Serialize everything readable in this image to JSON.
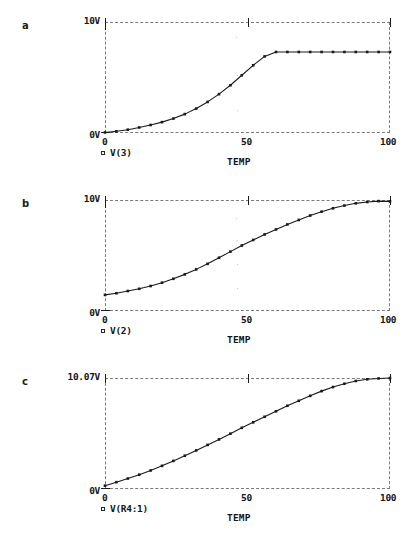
{
  "figure": {
    "background": "#ffffff",
    "line_color": "#1a1a1a",
    "axis_color": "#7b7b7b"
  },
  "panels": [
    {
      "letter": "a",
      "y_top_label": "10V",
      "y_bottom_label": "0V",
      "x_ticks": [
        "0",
        "50",
        "100"
      ],
      "x_axis_title": "TEMP",
      "legend_label": "V(3)",
      "chart_data": {
        "type": "line",
        "title": "",
        "xlabel": "TEMP",
        "ylabel": "",
        "xlim": [
          0,
          100
        ],
        "ylim": [
          0,
          10
        ],
        "ytick_labels": [
          "0V",
          "10V"
        ],
        "xtick_labels": [
          "0",
          "50",
          "100"
        ],
        "grid": false,
        "legend_position": "below-left",
        "series": [
          {
            "name": "V(3)",
            "markers": true,
            "x": [
              0,
              4,
              8,
              12,
              16,
              20,
              24,
              28,
              32,
              36,
              40,
              44,
              48,
              52,
              56,
              60,
              64,
              68,
              72,
              76,
              80,
              84,
              88,
              92,
              96,
              100
            ],
            "values": [
              0.05,
              0.15,
              0.3,
              0.5,
              0.72,
              0.98,
              1.3,
              1.7,
              2.2,
              2.8,
              3.5,
              4.3,
              5.2,
              6.1,
              6.9,
              7.3,
              7.3,
              7.3,
              7.3,
              7.3,
              7.3,
              7.3,
              7.3,
              7.3,
              7.3,
              7.3
            ]
          }
        ]
      }
    },
    {
      "letter": "b",
      "y_top_label": "10V",
      "y_bottom_label": "0V",
      "x_ticks": [
        "0",
        "50",
        "100"
      ],
      "x_axis_title": "TEMP",
      "legend_label": "V(2)",
      "chart_data": {
        "type": "line",
        "title": "",
        "xlabel": "TEMP",
        "ylabel": "",
        "xlim": [
          0,
          100
        ],
        "ylim": [
          0,
          10
        ],
        "ytick_labels": [
          "0V",
          "10V"
        ],
        "xtick_labels": [
          "0",
          "50",
          "100"
        ],
        "grid": false,
        "legend_position": "below-left",
        "series": [
          {
            "name": "V(2)",
            "markers": true,
            "x": [
              0,
              4,
              8,
              12,
              16,
              20,
              24,
              28,
              32,
              36,
              40,
              44,
              48,
              52,
              56,
              60,
              64,
              68,
              72,
              76,
              80,
              84,
              88,
              92,
              96,
              100
            ],
            "values": [
              1.45,
              1.6,
              1.8,
              2.0,
              2.25,
              2.55,
              2.9,
              3.3,
              3.75,
              4.25,
              4.8,
              5.35,
              5.9,
              6.4,
              6.9,
              7.35,
              7.8,
              8.2,
              8.6,
              8.95,
              9.25,
              9.5,
              9.7,
              9.82,
              9.9,
              9.88
            ]
          }
        ]
      }
    },
    {
      "letter": "c",
      "y_top_label": "10.07V",
      "y_bottom_label": "0V",
      "x_ticks": [
        "0",
        "50",
        "100"
      ],
      "x_axis_title": "TEMP",
      "legend_label": "V(R4:1)",
      "chart_data": {
        "type": "line",
        "title": "",
        "xlabel": "TEMP",
        "ylabel": "",
        "xlim": [
          0,
          100
        ],
        "ylim": [
          0,
          10.07
        ],
        "ytick_labels": [
          "0V",
          "10.07V"
        ],
        "xtick_labels": [
          "0",
          "50",
          "100"
        ],
        "grid": false,
        "legend_position": "below-left",
        "series": [
          {
            "name": "V(R4:1)",
            "markers": true,
            "x": [
              0,
              4,
              8,
              12,
              16,
              20,
              24,
              28,
              32,
              36,
              40,
              44,
              48,
              52,
              56,
              60,
              64,
              68,
              72,
              76,
              80,
              84,
              88,
              92,
              96,
              100
            ],
            "values": [
              0.3,
              0.62,
              0.95,
              1.3,
              1.68,
              2.1,
              2.55,
              3.02,
              3.5,
              4.0,
              4.5,
              5.02,
              5.55,
              6.05,
              6.55,
              7.05,
              7.55,
              8.0,
              8.45,
              8.88,
              9.25,
              9.55,
              9.8,
              9.95,
              10.03,
              10.07
            ]
          }
        ]
      }
    }
  ]
}
